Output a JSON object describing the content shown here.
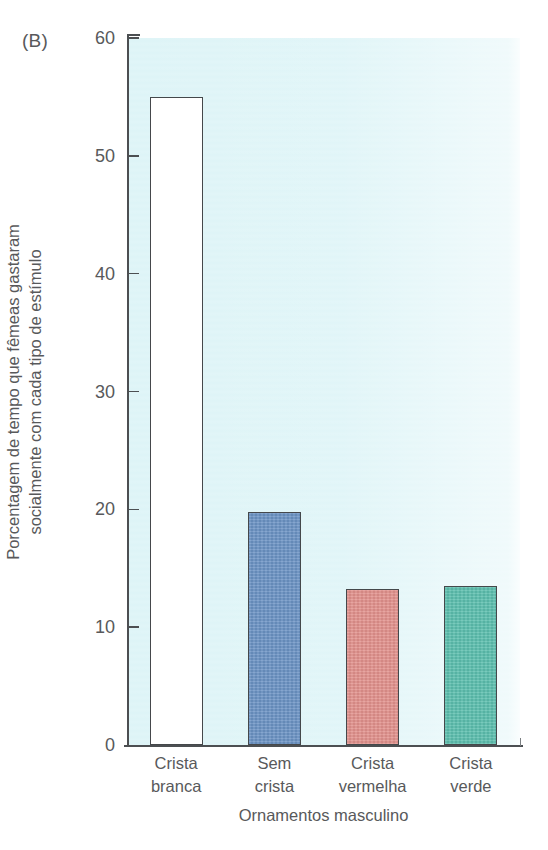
{
  "panel": {
    "label": "(B)"
  },
  "chart_data": {
    "type": "bar",
    "title": "",
    "panel_label": "(B)",
    "categories": [
      "Crista branca",
      "Sem crista",
      "Crista vermelha",
      "Crista verde"
    ],
    "category_lines": [
      [
        "Crista",
        "branca"
      ],
      [
        "Sem",
        "crista"
      ],
      [
        "Crista",
        "vermelha"
      ],
      [
        "Crista",
        "verde"
      ]
    ],
    "values": [
      55,
      19.8,
      13.2,
      13.5
    ],
    "xlabel": "Ornamentos masculino",
    "ylabel": "Porcentagem de tempo que fêmeas gastaram socialmente com cada tipo de estímulo",
    "ylabel_lines": [
      "Porcentagem de tempo que fêmeas gastaram",
      "socialmente com cada tipo de estímulo"
    ],
    "ylim": [
      0,
      60
    ],
    "ytick_values": [
      0,
      10,
      20,
      30,
      40,
      50,
      60
    ],
    "ytick_labels": [
      "0",
      "10",
      "20",
      "30",
      "40",
      "50",
      "60"
    ],
    "grid": false,
    "legend": "none",
    "bar_colors": [
      "#ffffff",
      "#6b93c4",
      "#e2918c",
      "#5cbfae"
    ],
    "bar_edge_color": "#45484b",
    "plot_background": "#ddf4f7",
    "text_color": "#58595b"
  }
}
